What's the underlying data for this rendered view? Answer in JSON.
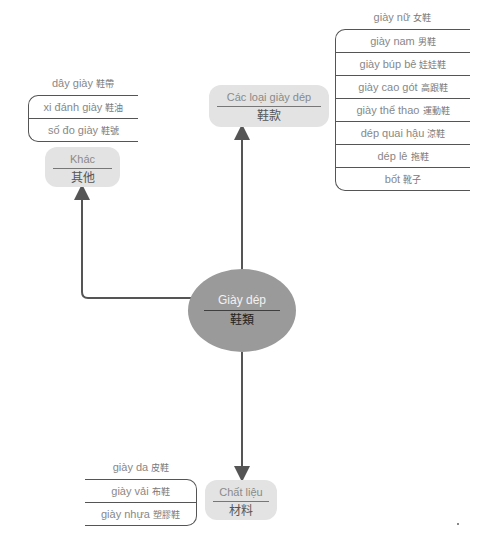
{
  "center": {
    "label_vi": "Giày dép",
    "label_zh": "鞋類"
  },
  "branches": {
    "types": {
      "label_vi": "Các loại giày dép",
      "label_zh": "鞋款",
      "items": [
        {
          "vi": "giày nữ",
          "zh": "女鞋"
        },
        {
          "vi": "giày nam",
          "zh": "男鞋"
        },
        {
          "vi": "giày búp bê",
          "zh": "娃娃鞋"
        },
        {
          "vi": "giày cao gót",
          "zh": "高跟鞋"
        },
        {
          "vi": "giày thể thao",
          "zh": "運動鞋"
        },
        {
          "vi": "dép quai hậu",
          "zh": "涼鞋"
        },
        {
          "vi": "dép lê",
          "zh": "拖鞋"
        },
        {
          "vi": "bốt",
          "zh": "靴子"
        }
      ]
    },
    "other": {
      "label_vi": "Khác",
      "label_zh": "其他",
      "items": [
        {
          "vi": "dây giày",
          "zh": "鞋帶"
        },
        {
          "vi": "xi đánh giày",
          "zh": "鞋油"
        },
        {
          "vi": "số đo giày",
          "zh": "鞋號"
        }
      ]
    },
    "material": {
      "label_vi": "Chất liệu",
      "label_zh": "材料",
      "items": [
        {
          "vi": "giày da",
          "zh": "皮鞋"
        },
        {
          "vi": "giày vải",
          "zh": "布鞋"
        },
        {
          "vi": "giày nhựa",
          "zh": "塑膠鞋"
        }
      ]
    }
  },
  "colors": {
    "center_fill": "#9a9a9a",
    "node_fill": "#e3e3e3",
    "line": "#555555"
  }
}
